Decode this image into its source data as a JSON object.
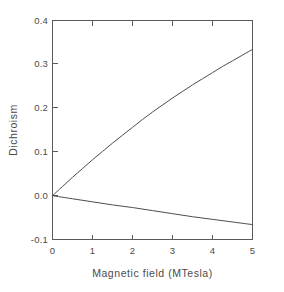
{
  "chart_data": {
    "type": "line",
    "title": "",
    "xlabel": "Magnetic field (MTesla)",
    "ylabel": "Dichroism",
    "xlim": [
      0,
      5
    ],
    "ylim": [
      -0.1,
      0.4
    ],
    "xticks": [
      "0",
      "1",
      "2",
      "3",
      "4",
      "5"
    ],
    "xtick_values": [
      0,
      1,
      2,
      3,
      4,
      5
    ],
    "yticks": [
      "-0.1",
      "0.0",
      "0.1",
      "0.2",
      "0.3",
      "0.4"
    ],
    "ytick_values": [
      -0.1,
      0.0,
      0.1,
      0.2,
      0.3,
      0.4
    ],
    "grid": false,
    "legend": null,
    "legend_position": "none",
    "tick_direction": "in",
    "line_color": "#4d4d4d",
    "axis_color": "#5a5a5a",
    "background_color": "#ffffff",
    "series": [
      {
        "name": "upper-branch",
        "x": [
          0,
          0.25,
          0.5,
          0.75,
          1.0,
          1.25,
          1.5,
          1.75,
          2.0,
          2.25,
          2.5,
          2.75,
          3.0,
          3.25,
          3.5,
          3.75,
          4.0,
          4.25,
          4.5,
          4.75,
          5.0
        ],
        "values": [
          0.0,
          0.021,
          0.042,
          0.062,
          0.082,
          0.101,
          0.12,
          0.138,
          0.156,
          0.174,
          0.191,
          0.207,
          0.223,
          0.238,
          0.253,
          0.267,
          0.281,
          0.295,
          0.308,
          0.321,
          0.334
        ]
      },
      {
        "name": "lower-branch",
        "x": [
          0,
          0.5,
          1.0,
          1.5,
          2.0,
          2.5,
          3.0,
          3.5,
          4.0,
          4.5,
          5.0
        ],
        "values": [
          0.0,
          -0.007,
          -0.014,
          -0.021,
          -0.027,
          -0.034,
          -0.041,
          -0.048,
          -0.054,
          -0.06,
          -0.066
        ]
      }
    ]
  },
  "axes": {
    "ylabel_text": "Dichroism",
    "xlabel_text": "Magnetic field (MTesla)"
  }
}
